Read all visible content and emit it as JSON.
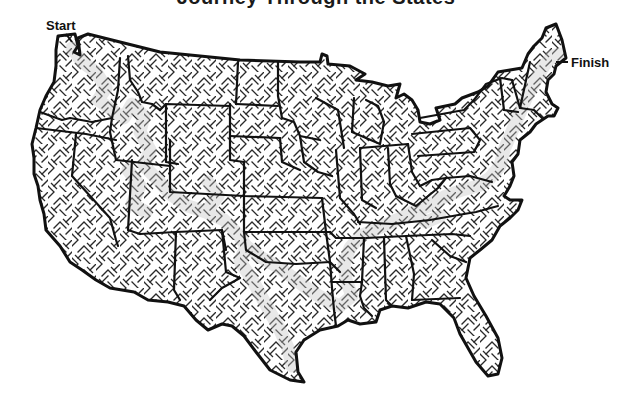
{
  "puzzle": {
    "title": "Journey Through the States",
    "start_label": "Start",
    "finish_label": "Finish",
    "description": "Maze in the shape of the contiguous United States with a shaded solution path from the Pacific Northwest to Maine"
  },
  "colors": {
    "outline": "#111111",
    "maze_wall": "#2a2a2a",
    "solution_path": "#c4c4c4",
    "background": "#ffffff"
  },
  "icons": {
    "map": "us-map-maze"
  }
}
